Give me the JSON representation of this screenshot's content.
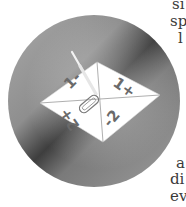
{
  "figure": {
    "quadrant_labels": {
      "top_left": "1-",
      "top_right": "1+",
      "bottom_left": "2+",
      "bottom_right": "-2"
    },
    "colors": {
      "disc_light": "#b8b8b8",
      "disc_dark": "#4a4a4a",
      "paper": "#ffffff"
    }
  },
  "side_text_fragments": [
    "si",
    "sp",
    "l",
    "a",
    "di",
    "ev"
  ]
}
